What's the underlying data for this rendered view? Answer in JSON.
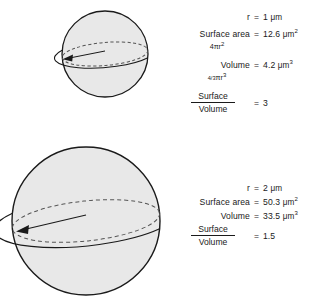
{
  "figure": {
    "type": "diagram",
    "fill_color": "#e8e8e8",
    "stroke_color": "#1a1a1a",
    "background_color": "#ffffff"
  },
  "small_sphere": {
    "shape_name": "sphere",
    "radius_arrow_label": "r",
    "stats": {
      "radius_label": "r",
      "radius_eq": "=",
      "radius_value": "1",
      "radius_unit": "μm",
      "surface_area_label": "Surface area",
      "surface_area_eq": "=",
      "surface_area_value": "12.6",
      "surface_area_unit": "μm",
      "surface_area_exp": "2",
      "surface_area_formula_prefix": "4",
      "surface_area_formula_pi": "π",
      "surface_area_formula_var": "r",
      "surface_area_formula_exp": "2",
      "volume_label": "Volume",
      "volume_eq": "=",
      "volume_value": "4.2",
      "volume_unit": "μm",
      "volume_exp": "3",
      "volume_formula_frac": "4/3",
      "volume_formula_pi": "π",
      "volume_formula_var": "r",
      "volume_formula_exp": "3",
      "ratio_numerator": "Surface",
      "ratio_denominator": "Volume",
      "ratio_eq": "=",
      "ratio_value": "3"
    }
  },
  "large_sphere": {
    "shape_name": "sphere",
    "radius_arrow_label": "r",
    "stats": {
      "radius_label": "r",
      "radius_eq": "=",
      "radius_value": "2",
      "radius_unit": "μm",
      "surface_area_label": "Surface area",
      "surface_area_eq": "=",
      "surface_area_value": "50.3",
      "surface_area_unit": "μm",
      "surface_area_exp": "2",
      "volume_label": "Volume",
      "volume_eq": "=",
      "volume_value": "33.5",
      "volume_unit": "μm",
      "volume_exp": "3",
      "ratio_numerator": "Surface",
      "ratio_denominator": "Volume",
      "ratio_eq": "=",
      "ratio_value": "1.5"
    }
  }
}
